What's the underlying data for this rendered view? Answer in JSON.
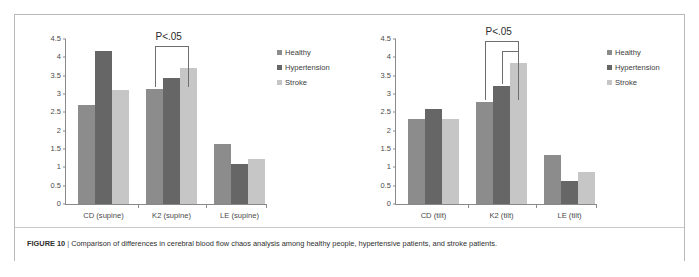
{
  "figure": {
    "label": "FIGURE 10",
    "separator": "|",
    "caption": "Comparison of differences in cerebral blood flow chaos analysis among healthy people, hypertensive patients, and stroke patients."
  },
  "series_colors": {
    "healthy": "#8c8c8c",
    "hypertension": "#666666",
    "stroke": "#c6c6c6"
  },
  "axis_color": "#8a8a8a",
  "chart_data": [
    {
      "type": "bar",
      "id": "supine",
      "title": "",
      "xlabel": "",
      "ylabel": "",
      "categories": [
        "CD (supine)",
        "K2 (supine)",
        "LE (supine)"
      ],
      "series": [
        {
          "name": "Healthy",
          "values": [
            2.69,
            3.14,
            1.63
          ]
        },
        {
          "name": "Hypertension",
          "values": [
            4.17,
            3.45,
            1.1
          ]
        },
        {
          "name": "Stroke",
          "values": [
            3.12,
            3.71,
            1.24
          ]
        }
      ],
      "ylim": [
        0,
        4.5
      ],
      "yticks": [
        "0",
        "0.5",
        "1",
        "1.5",
        "2",
        "2.5",
        "3",
        "3.5",
        "4",
        "4.5"
      ],
      "ytick_values": [
        0,
        0.5,
        1,
        1.5,
        2,
        2.5,
        3,
        3.5,
        4,
        4.5
      ],
      "grid": false,
      "legend": [
        "Healthy",
        "Hypertension",
        "Stroke"
      ],
      "legend_position": "top-right",
      "annotations": [
        {
          "text": "P<.05",
          "category": "K2 (supine)",
          "from_series": "Healthy",
          "to_series": "Stroke",
          "level": 1
        }
      ]
    },
    {
      "type": "bar",
      "id": "tilt",
      "title": "",
      "xlabel": "",
      "ylabel": "",
      "categories": [
        "CD (tilt)",
        "K2 (tilt)",
        "LE (tilt)"
      ],
      "series": [
        {
          "name": "Healthy",
          "values": [
            2.31,
            2.79,
            1.33
          ]
        },
        {
          "name": "Hypertension",
          "values": [
            2.6,
            3.23,
            0.63
          ]
        },
        {
          "name": "Stroke",
          "values": [
            2.33,
            3.84,
            0.88
          ]
        }
      ],
      "ylim": [
        0,
        4.5
      ],
      "yticks": [
        "0",
        "0.5",
        "1",
        "1.5",
        "2",
        "2.5",
        "3",
        "3.5",
        "4",
        "4.5"
      ],
      "ytick_values": [
        0,
        0.5,
        1,
        1.5,
        2,
        2.5,
        3,
        3.5,
        4,
        4.5
      ],
      "grid": false,
      "legend": [
        "Healthy",
        "Hypertension",
        "Stroke"
      ],
      "legend_position": "top-right",
      "annotations": [
        {
          "text": "P<.05",
          "category": "K2 (tilt)",
          "from_series": "Healthy",
          "to_series": "Stroke",
          "level": 1
        },
        {
          "text": "",
          "category": "K2 (tilt)",
          "from_series": "Hypertension",
          "to_series": "Stroke",
          "level": 2
        }
      ]
    }
  ]
}
